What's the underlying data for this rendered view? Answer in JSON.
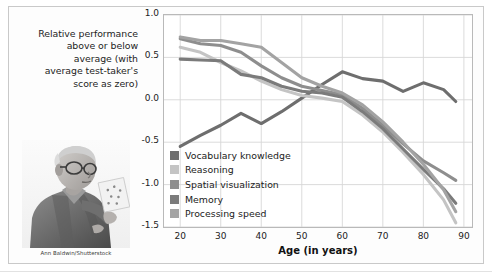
{
  "figure": {
    "y_axis_caption": "Relative performance above or below average (with average test-taker's score as zero)",
    "y_axis_caption_lines": [
      "Relative performance",
      "above or below",
      "average (with",
      "average test-taker's",
      "score as zero)"
    ],
    "photo_credit": "Ann Baldwin/Shutterstock",
    "photo_alt": "elderly-man-reading-card"
  },
  "legend": {
    "position": "inside-lower-left",
    "items": [
      {
        "label": "Vocabulary knowledge",
        "color": "#6e6e6e"
      },
      {
        "label": "Reasoning",
        "color": "#c4c4c4"
      },
      {
        "label": "Spatial visualization",
        "color": "#8e8e8e"
      },
      {
        "label": "Memory",
        "color": "#7b7b7b"
      },
      {
        "label": "Processing speed",
        "color": "#a3a3a3"
      }
    ]
  },
  "chart_data": {
    "type": "line",
    "title": "",
    "subtitle": "",
    "xlabel": "Age (in years)",
    "ylabel": "Relative performance above or below average (with average test-taker's score as zero)",
    "xlim": [
      16,
      92
    ],
    "ylim": [
      -1.5,
      1.0
    ],
    "xticks": [
      20,
      30,
      40,
      50,
      60,
      70,
      80,
      90
    ],
    "yticks": [
      1.0,
      0.5,
      0.0,
      -0.5,
      -1.0,
      -1.5
    ],
    "ytick_labels": [
      "1.0",
      "0.5",
      "0.0",
      "-0.5",
      "-1.0",
      "-1.5"
    ],
    "grid": true,
    "legend_position": "lower left inside plot",
    "x": [
      20,
      25,
      30,
      35,
      40,
      45,
      50,
      55,
      60,
      65,
      70,
      75,
      80,
      85,
      88
    ],
    "series": [
      {
        "name": "Vocabulary knowledge",
        "color": "#6e6e6e",
        "values": [
          -0.55,
          -0.42,
          -0.3,
          -0.16,
          -0.28,
          -0.14,
          0.02,
          0.18,
          0.33,
          0.25,
          0.22,
          0.1,
          0.2,
          0.12,
          -0.02
        ]
      },
      {
        "name": "Reasoning",
        "color": "#c4c4c4",
        "values": [
          0.62,
          0.56,
          0.44,
          0.34,
          0.22,
          0.12,
          0.05,
          0.02,
          -0.02,
          -0.18,
          -0.38,
          -0.62,
          -0.88,
          -1.18,
          -1.45
        ]
      },
      {
        "name": "Spatial visualization",
        "color": "#8e8e8e",
        "values": [
          0.72,
          0.66,
          0.64,
          0.56,
          0.4,
          0.26,
          0.16,
          0.11,
          0.06,
          -0.1,
          -0.3,
          -0.52,
          -0.72,
          -0.86,
          -0.95
        ]
      },
      {
        "name": "Memory",
        "color": "#7b7b7b",
        "values": [
          0.48,
          0.47,
          0.46,
          0.3,
          0.26,
          0.16,
          0.1,
          0.08,
          0.03,
          -0.14,
          -0.34,
          -0.58,
          -0.82,
          -1.05,
          -1.22
        ]
      },
      {
        "name": "Processing speed",
        "color": "#a3a3a3",
        "values": [
          0.74,
          0.7,
          0.7,
          0.66,
          0.62,
          0.44,
          0.26,
          0.16,
          0.08,
          -0.06,
          -0.26,
          -0.5,
          -0.76,
          -1.06,
          -1.32
        ]
      }
    ]
  }
}
